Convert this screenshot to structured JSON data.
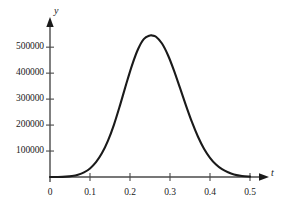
{
  "figure": {
    "background_color": "#ffffff",
    "curve_color": "#1a1a1a",
    "axis_color": "#4a4a4a",
    "text_color": "#1a1a1a"
  },
  "axes": {
    "x_axis_name": "t",
    "y_axis_name": "y",
    "x_ticks": [
      "0",
      "0.1",
      "0.2",
      "0.3",
      "0.4",
      "0.5"
    ],
    "y_ticks": [
      "100000",
      "200000",
      "300000",
      "400000",
      "500000"
    ],
    "origin_label": "0"
  },
  "chart_data": {
    "type": "line",
    "title": "",
    "subtitle": "",
    "xlabel": "t",
    "ylabel": "y",
    "xlim": [
      0,
      0.5
    ],
    "ylim": [
      0,
      570000
    ],
    "grid": false,
    "legend": null,
    "x_tick_values": [
      0,
      0.1,
      0.2,
      0.3,
      0.4,
      0.5
    ],
    "x_tick_labels": [
      "0",
      "0.1",
      "0.2",
      "0.3",
      "0.4",
      "0.5"
    ],
    "y_tick_values": [
      100000,
      200000,
      300000,
      400000,
      500000
    ],
    "y_tick_labels": [
      "100000",
      "200000",
      "300000",
      "400000",
      "500000"
    ],
    "peak": {
      "x": 0.255,
      "y": 545000
    },
    "series": [
      {
        "name": "y(t)",
        "color": "#1a1a1a",
        "x": [
          0.0,
          0.02,
          0.04,
          0.055,
          0.07,
          0.085,
          0.1,
          0.115,
          0.13,
          0.145,
          0.16,
          0.175,
          0.19,
          0.205,
          0.22,
          0.235,
          0.25,
          0.255,
          0.265,
          0.28,
          0.295,
          0.31,
          0.325,
          0.34,
          0.355,
          0.37,
          0.385,
          0.4,
          0.415,
          0.43,
          0.445,
          0.46,
          0.48,
          0.5
        ],
        "y": [
          0,
          200,
          1500,
          4000,
          9000,
          18000,
          33000,
          57000,
          92000,
          140000,
          202000,
          276000,
          355000,
          430000,
          492000,
          532000,
          545000,
          545000,
          540000,
          514000,
          469000,
          410000,
          343000,
          275000,
          211000,
          155000,
          109000,
          74000,
          48000,
          30000,
          18000,
          10000,
          4000,
          1500
        ]
      }
    ]
  }
}
